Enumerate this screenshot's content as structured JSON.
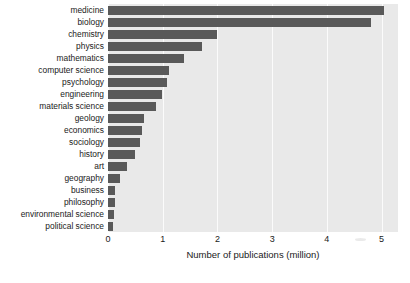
{
  "chart_data": {
    "type": "bar",
    "orientation": "horizontal",
    "title": "",
    "xlabel": "Number of publications (million)",
    "ylabel": "",
    "xlim": [
      0,
      5.3
    ],
    "xticks": [
      0,
      1,
      2,
      3,
      4,
      5
    ],
    "xtick_labels": [
      "0",
      "1",
      "2",
      "3",
      "4",
      "5"
    ],
    "grid": true,
    "grid_axis": "x",
    "legend": false,
    "categories": [
      "medicine",
      "biology",
      "chemistry",
      "physics",
      "mathematics",
      "computer science",
      "psychology",
      "engineering",
      "materials science",
      "geology",
      "economics",
      "sociology",
      "history",
      "art",
      "geography",
      "business",
      "philosophy",
      "environmental science",
      "political science"
    ],
    "values": [
      5.05,
      4.8,
      2.0,
      1.72,
      1.38,
      1.12,
      1.07,
      0.98,
      0.87,
      0.66,
      0.62,
      0.58,
      0.5,
      0.35,
      0.22,
      0.13,
      0.12,
      0.11,
      0.1
    ],
    "bar_color": "#595959",
    "plot_background": "#e9e9e9",
    "grid_color": "#fbfbfb",
    "figure_background": "#ffffff"
  }
}
